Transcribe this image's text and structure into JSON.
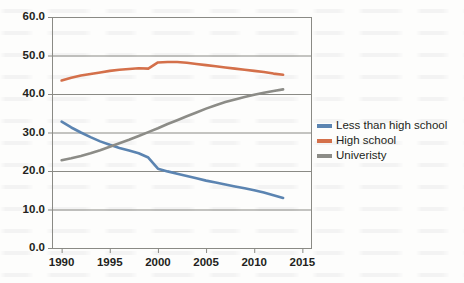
{
  "chart_data": {
    "type": "line",
    "title": "",
    "xlabel": "",
    "ylabel": "",
    "xlim": [
      1989,
      2016
    ],
    "ylim": [
      0.0,
      60.0
    ],
    "grid": true,
    "grid_axis": "y",
    "legend_position": "right",
    "x_tick_labels": [
      "1990",
      "1995",
      "2000",
      "2005",
      "2010",
      "2015"
    ],
    "x_ticks": [
      1990,
      1995,
      2000,
      2005,
      2010,
      2015
    ],
    "y_tick_labels": [
      "0.0",
      "10.0",
      "20.0",
      "30.0",
      "40.0",
      "50.0",
      "60.0"
    ],
    "y_ticks": [
      0.0,
      10.0,
      20.0,
      30.0,
      40.0,
      50.0,
      60.0
    ],
    "series": [
      {
        "name": "Less than high school",
        "color": "#5b84b1",
        "x": [
          1990,
          1991,
          1992,
          1993,
          1994,
          1995,
          1996,
          1997,
          1998,
          1999,
          2000,
          2001,
          2002,
          2003,
          2004,
          2005,
          2006,
          2007,
          2008,
          2009,
          2010,
          2011,
          2012,
          2013
        ],
        "values": [
          32.8,
          31.3,
          30.0,
          28.8,
          27.7,
          26.8,
          26.0,
          25.3,
          24.6,
          23.5,
          20.6,
          19.9,
          19.3,
          18.7,
          18.1,
          17.5,
          17.0,
          16.5,
          16.0,
          15.5,
          15.0,
          14.4,
          13.7,
          13.0
        ]
      },
      {
        "name": "High school",
        "color": "#d4704a",
        "x": [
          1990,
          1991,
          1992,
          1993,
          1994,
          1995,
          1996,
          1997,
          1998,
          1999,
          2000,
          2001,
          2002,
          2003,
          2004,
          2005,
          2006,
          2007,
          2008,
          2009,
          2010,
          2011,
          2012,
          2013
        ],
        "values": [
          43.5,
          44.2,
          44.8,
          45.2,
          45.6,
          46.0,
          46.3,
          46.5,
          46.7,
          46.6,
          48.2,
          48.3,
          48.3,
          48.1,
          47.8,
          47.5,
          47.2,
          46.9,
          46.6,
          46.3,
          46.0,
          45.7,
          45.3,
          45.0
        ]
      },
      {
        "name": "Univeristy",
        "color": "#8c8c87",
        "x": [
          1990,
          1991,
          1992,
          1993,
          1994,
          1995,
          1996,
          1997,
          1998,
          1999,
          2000,
          2001,
          2002,
          2003,
          2004,
          2005,
          2006,
          2007,
          2008,
          2009,
          2010,
          2011,
          2012,
          2013
        ],
        "values": [
          22.8,
          23.3,
          23.9,
          24.6,
          25.4,
          26.3,
          27.2,
          28.1,
          29.1,
          30.1,
          31.1,
          32.2,
          33.2,
          34.2,
          35.2,
          36.2,
          37.1,
          37.9,
          38.6,
          39.2,
          39.8,
          40.3,
          40.8,
          41.2
        ]
      }
    ]
  },
  "legend": {
    "items": [
      {
        "label": "Less than high school",
        "color": "#5b84b1"
      },
      {
        "label": "High school",
        "color": "#d4704a"
      },
      {
        "label": "Univeristy",
        "color": "#8c8c87"
      }
    ]
  },
  "axes": {
    "axis_color": "#8a8a85",
    "grid_color": "#8a8a85",
    "tick_text_color": "#231f20"
  }
}
